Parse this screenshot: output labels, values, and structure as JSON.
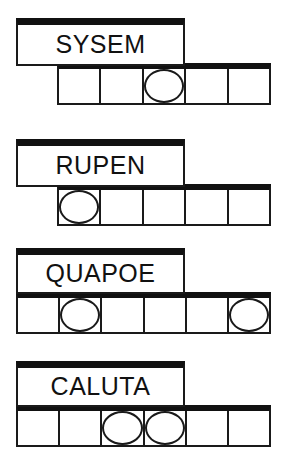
{
  "page": {
    "type": "word-scramble-puzzle-worksheet",
    "background_color": "#ffffff",
    "ink_color": "#111111"
  },
  "puzzle_rows": [
    {
      "word": "SYSEM",
      "plate": {
        "x": 16,
        "y": 18,
        "width": 169,
        "height": 48
      },
      "grid": {
        "x": 57,
        "y": 63,
        "width": 214,
        "height": 42,
        "cells": 5
      },
      "circled_cells": [
        3
      ]
    },
    {
      "word": "RUPEN",
      "plate": {
        "x": 16,
        "y": 139,
        "width": 169,
        "height": 48
      },
      "grid": {
        "x": 57,
        "y": 184,
        "width": 214,
        "height": 42,
        "cells": 5
      },
      "circled_cells": [
        1
      ]
    },
    {
      "word": "QUAPOE",
      "plate": {
        "x": 16,
        "y": 248,
        "width": 169,
        "height": 46
      },
      "grid": {
        "x": 16,
        "y": 292,
        "width": 255,
        "height": 42,
        "cells": 6
      },
      "circled_cells": [
        2,
        6
      ]
    },
    {
      "word": "CALUTA",
      "plate": {
        "x": 16,
        "y": 361,
        "width": 169,
        "height": 46
      },
      "grid": {
        "x": 16,
        "y": 405,
        "width": 255,
        "height": 42,
        "cells": 6
      },
      "circled_cells": [
        3,
        4
      ]
    }
  ]
}
